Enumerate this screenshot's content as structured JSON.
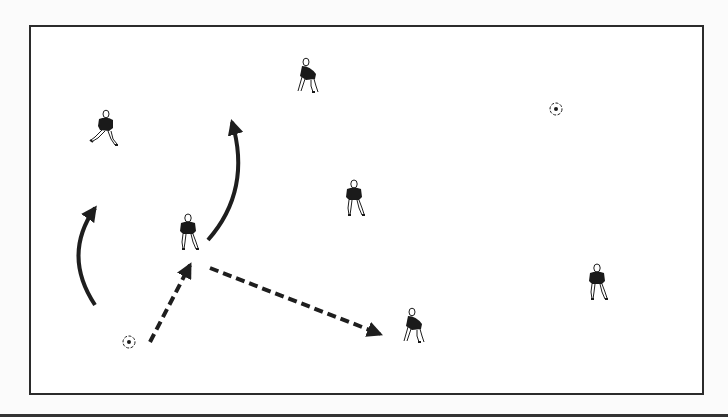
{
  "diagram": {
    "type": "soccer-drill",
    "colors": {
      "ink": "#1e1e1e",
      "field_border": "#2b2b2b",
      "background": "#ffffff",
      "shirt": "#1a1a1a",
      "shorts": "#ffffff"
    },
    "field": {
      "x": 29,
      "y": 25,
      "width": 673,
      "height": 368
    },
    "players": [
      {
        "id": "p1",
        "x": 105,
        "y": 128,
        "pose": "running",
        "has_ball": false
      },
      {
        "id": "p2",
        "x": 308,
        "y": 76,
        "pose": "crouching",
        "has_ball": false
      },
      {
        "id": "p3",
        "x": 568,
        "y": 88,
        "pose": "dribbling",
        "has_ball": true,
        "ball": {
          "x": 556,
          "y": 109
        }
      },
      {
        "id": "p4",
        "x": 354,
        "y": 198,
        "pose": "standing",
        "has_ball": false
      },
      {
        "id": "p5",
        "x": 188,
        "y": 232,
        "pose": "standing",
        "has_ball": false
      },
      {
        "id": "p6",
        "x": 112,
        "y": 323,
        "pose": "dribbling",
        "has_ball": true,
        "ball": {
          "x": 129,
          "y": 342
        }
      },
      {
        "id": "p7",
        "x": 414,
        "y": 326,
        "pose": "crouching",
        "has_ball": false
      },
      {
        "id": "p8",
        "x": 597,
        "y": 282,
        "pose": "standing",
        "has_ball": false
      }
    ],
    "arrows": [
      {
        "id": "run-left",
        "kind": "player-run",
        "style": "solid-curved",
        "path": "M95,305 Q62,255 95,208"
      },
      {
        "id": "run-right",
        "kind": "player-run",
        "style": "solid-curved",
        "path": "M208,240 Q252,190 232,122"
      },
      {
        "id": "pass-1",
        "kind": "ball-pass",
        "style": "dashed",
        "from": [
          150,
          342
        ],
        "to": [
          190,
          265
        ]
      },
      {
        "id": "pass-2",
        "kind": "ball-pass",
        "style": "dashed",
        "from": [
          210,
          268
        ],
        "to": [
          380,
          334
        ]
      }
    ]
  }
}
